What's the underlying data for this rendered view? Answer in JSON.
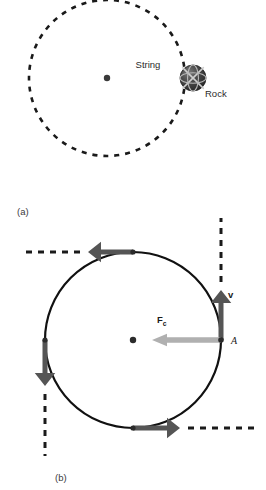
{
  "figure": {
    "background_color": "#ffffff",
    "width": 266,
    "height": 490
  },
  "panel_a": {
    "caption": "(a)",
    "caption_pos": {
      "x": 17,
      "y": 215
    },
    "description": "Rock on a string swung in a horizontal circle",
    "circle": {
      "cx": 107,
      "cy": 78,
      "r": 78,
      "style": "dashed",
      "color": "#1a1a1a",
      "stroke_width": 2.6,
      "dash": "5 6"
    },
    "pivot_dot": {
      "cx": 107,
      "cy": 78,
      "r": 3.2,
      "color": "#3a3a3a"
    },
    "string": {
      "label": "String",
      "label_pos": {
        "x": 148,
        "y": 68
      },
      "x1": 107,
      "y1": 78,
      "x2": 190,
      "y2": 78,
      "color": "#8a8a8a",
      "stroke_width": 4.4
    },
    "rock": {
      "label": "Rock",
      "label_pos": {
        "x": 205,
        "y": 97
      },
      "cx": 193,
      "cy": 78,
      "r": 13,
      "color": "#3f3f3f",
      "highlight_color": "#6e6e6e",
      "shadow_color": "#232323"
    }
  },
  "panel_b": {
    "caption": "(b)",
    "caption_pos": {
      "x": 55,
      "y": 481
    },
    "description": "Centripetal force and tangential velocity around the circular path",
    "circle": {
      "cx": 133,
      "cy": 340,
      "r": 88,
      "style": "solid",
      "color": "#111111",
      "stroke_width": 2.2
    },
    "center_dot": {
      "cx": 133,
      "cy": 340,
      "r": 3.2,
      "color": "#2b2b2b"
    },
    "point_a": {
      "label": "A",
      "label_pos": {
        "x": 231,
        "y": 344
      },
      "cx": 221,
      "cy": 340,
      "r": 2.8,
      "color": "#2b2b2b"
    },
    "centripetal_force": {
      "label": "F",
      "subscript": "c",
      "label_pos": {
        "x": 157,
        "y": 323
      },
      "x1": 221,
      "y1": 340,
      "x2": 152,
      "y2": 340,
      "color": "#b0b0b0",
      "stroke_width": 5.5,
      "direction": "left"
    },
    "velocity": {
      "label": "v",
      "label_pos": {
        "x": 228,
        "y": 298
      },
      "x1": 221,
      "y1": 340,
      "x2": 221,
      "y2": 290,
      "color": "#555555",
      "stroke_width": 5.0,
      "direction": "up",
      "dashed_extension": {
        "x1": 221,
        "y1": 282,
        "x2": 221,
        "y2": 218
      }
    },
    "tangent_vectors": [
      {
        "name": "top-tangent",
        "origin": {
          "x": 133,
          "y": 252
        },
        "tip": {
          "x": 88,
          "y": 252
        },
        "direction": "left",
        "color": "#555555",
        "stroke_width": 5.0,
        "dashed_extension": {
          "x1": 80,
          "y1": 252,
          "x2": 25,
          "y2": 252
        }
      },
      {
        "name": "left-tangent",
        "origin": {
          "x": 45,
          "y": 340
        },
        "tip": {
          "x": 45,
          "y": 386
        },
        "direction": "down",
        "color": "#555555",
        "stroke_width": 5.0,
        "dashed_extension": {
          "x1": 45,
          "y1": 394,
          "x2": 45,
          "y2": 456
        }
      },
      {
        "name": "bottom-tangent",
        "origin": {
          "x": 133,
          "y": 428
        },
        "tip": {
          "x": 180,
          "y": 428
        },
        "direction": "right",
        "color": "#555555",
        "stroke_width": 5.0,
        "dashed_extension": {
          "x1": 188,
          "y1": 428,
          "x2": 258,
          "y2": 428
        }
      }
    ],
    "path_dots": [
      {
        "cx": 133,
        "cy": 252,
        "r": 2.6,
        "color": "#2b2b2b"
      },
      {
        "cx": 45,
        "cy": 340,
        "r": 2.6,
        "color": "#2b2b2b"
      },
      {
        "cx": 133,
        "cy": 428,
        "r": 2.6,
        "color": "#2b2b2b"
      }
    ],
    "dash_pattern": "6 6",
    "dash_color": "#1a1a1a",
    "dash_width": 3.0
  }
}
